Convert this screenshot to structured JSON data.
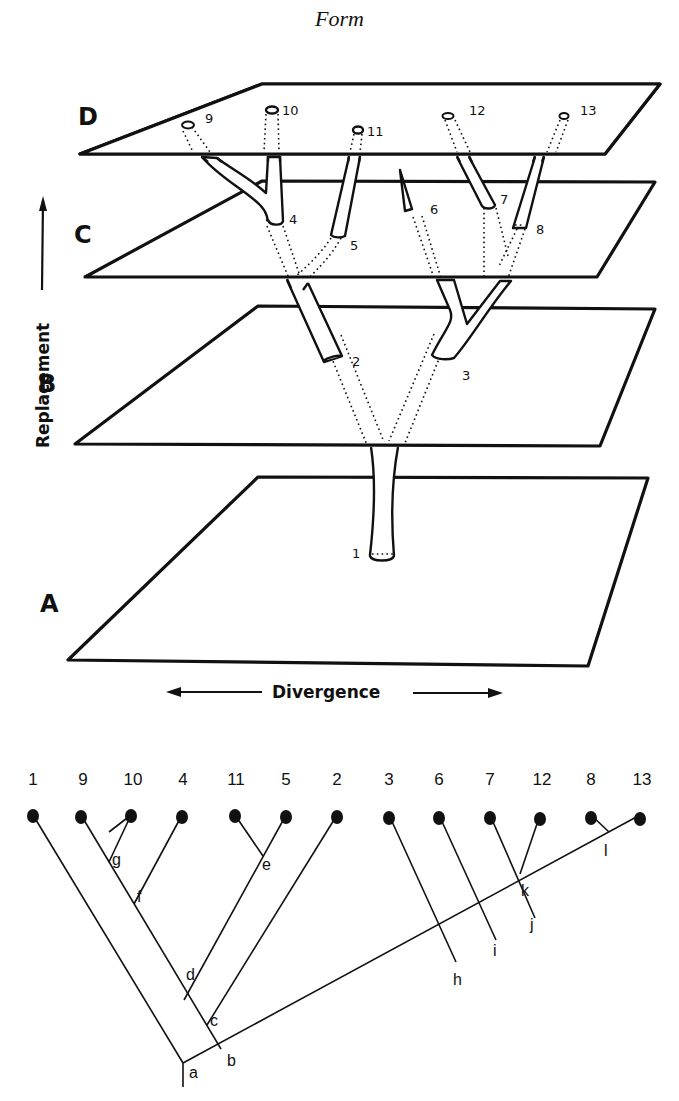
{
  "title": "Form",
  "figure_3d": {
    "planes": [
      {
        "label": "D",
        "points": "262,84 660,84 605,154 80,154"
      },
      {
        "label": "C",
        "points": "262,181 655,182 597,277 85,277"
      },
      {
        "label": "B",
        "points": "258,306 655,309 600,446 75,444"
      },
      {
        "label": "A",
        "points": "258,477 648,478 588,666 68,660"
      }
    ],
    "plane_labels": {
      "D": "D",
      "C": "C",
      "B": "B",
      "A": "A"
    },
    "numbers": {
      "n1": "1",
      "n2": "2",
      "n3": "3",
      "n4": "4",
      "n5": "5",
      "n6": "6",
      "n7": "7",
      "n8": "8",
      "n9": "9",
      "n10": "10",
      "n11": "11",
      "n12": "12",
      "n13": "13"
    },
    "y_axis_label": "Replacement",
    "x_axis_label": "Divergence"
  },
  "tree": {
    "leaves": [
      {
        "label": "1",
        "x": 33
      },
      {
        "label": "9",
        "x": 81
      },
      {
        "label": "10",
        "x": 131
      },
      {
        "label": "4",
        "x": 182
      },
      {
        "label": "11",
        "x": 235
      },
      {
        "label": "5",
        "x": 286
      },
      {
        "label": "2",
        "x": 337
      },
      {
        "label": "3",
        "x": 389
      },
      {
        "label": "6",
        "x": 439
      },
      {
        "label": "7",
        "x": 490
      },
      {
        "label": "12",
        "x": 540
      },
      {
        "label": "8",
        "x": 591
      },
      {
        "label": "13",
        "x": 640
      }
    ],
    "nodes": {
      "a": "a",
      "b": "b",
      "c": "c",
      "d": "d",
      "e": "e",
      "f": "f",
      "g": "g",
      "h": "h",
      "i": "i",
      "j": "j",
      "k": "k",
      "l": "l"
    }
  }
}
